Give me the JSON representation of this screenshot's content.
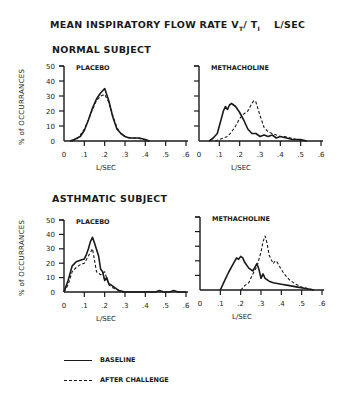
{
  "title": {
    "main": "MEAN INSPIRATORY FLOW RATE V",
    "sub1": "T",
    "slash": "/ T",
    "sub2": "I",
    "unit": "L/SEC"
  },
  "sections": {
    "normal": "NORMAL  SUBJECT",
    "asthmatic": "ASTHMATIC SUBJECT"
  },
  "ylabel": "% of OCCURRANCES",
  "legend": {
    "solid": "BASELINE",
    "dashed": "AFTER CHALLENGE"
  },
  "colors": {
    "ink": "#1a1a1a",
    "background": "#ffffff"
  },
  "chart_data": [
    {
      "type": "line",
      "title": "PLACEBO",
      "panel": "NORMAL SUBJECT",
      "xlabel": "L/SEC",
      "ylabel": "% of OCCURRANCES",
      "xlim": [
        0,
        0.6
      ],
      "ylim": [
        0,
        50
      ],
      "xticks": [
        "0",
        ".1",
        ".2",
        ".3",
        ".4",
        ".5",
        ".6"
      ],
      "yticks": [
        "0",
        "10",
        "20",
        "30",
        "40",
        "50"
      ],
      "series": [
        {
          "name": "BASELINE",
          "style": "solid",
          "x": [
            0.03,
            0.05,
            0.08,
            0.1,
            0.12,
            0.14,
            0.16,
            0.18,
            0.2,
            0.22,
            0.24,
            0.26,
            0.28,
            0.3,
            0.32,
            0.35,
            0.37,
            0.4,
            0.42
          ],
          "y": [
            0,
            1,
            3,
            7,
            14,
            22,
            28,
            32,
            35,
            27,
            16,
            8,
            5,
            3,
            2,
            2,
            2,
            1,
            0
          ]
        },
        {
          "name": "AFTER CHALLENGE",
          "style": "dashed",
          "x": [
            0.04,
            0.06,
            0.08,
            0.1,
            0.12,
            0.14,
            0.16,
            0.18,
            0.2,
            0.22,
            0.24,
            0.26,
            0.28,
            0.3,
            0.33,
            0.36,
            0.39,
            0.42
          ],
          "y": [
            0,
            1,
            4,
            8,
            14,
            21,
            27,
            30,
            31,
            26,
            17,
            9,
            5,
            3,
            2,
            2,
            1,
            0
          ]
        }
      ]
    },
    {
      "type": "line",
      "title": "METHACHOLINE",
      "panel": "NORMAL SUBJECT",
      "xlabel": "L/SEC",
      "xlim": [
        0,
        0.6
      ],
      "ylim": [
        0,
        50
      ],
      "xticks": [
        "0",
        ".1",
        ".2",
        ".3",
        ".4",
        ".5",
        ".6"
      ],
      "series": [
        {
          "name": "BASELINE",
          "style": "solid",
          "x": [
            0.05,
            0.07,
            0.09,
            0.11,
            0.12,
            0.13,
            0.14,
            0.15,
            0.16,
            0.18,
            0.2,
            0.22,
            0.24,
            0.26,
            0.28,
            0.3,
            0.32,
            0.34,
            0.36,
            0.38,
            0.4,
            0.43,
            0.46,
            0.5,
            0.53
          ],
          "y": [
            0,
            2,
            5,
            15,
            20,
            23,
            21,
            24,
            25,
            23,
            19,
            14,
            8,
            5,
            5,
            3,
            4,
            3,
            4,
            2,
            3,
            2,
            1,
            1,
            0
          ]
        },
        {
          "name": "AFTER CHALLENGE",
          "style": "dashed",
          "x": [
            0.08,
            0.1,
            0.12,
            0.14,
            0.16,
            0.18,
            0.2,
            0.22,
            0.24,
            0.26,
            0.27,
            0.28,
            0.3,
            0.32,
            0.34,
            0.36,
            0.38,
            0.4,
            0.42,
            0.45,
            0.48,
            0.52
          ],
          "y": [
            0,
            1,
            2,
            3,
            6,
            10,
            15,
            18,
            20,
            25,
            27,
            26,
            17,
            9,
            6,
            5,
            4,
            3,
            3,
            2,
            1,
            0
          ]
        }
      ]
    },
    {
      "type": "line",
      "title": "PLACEBO",
      "panel": "ASTHMATIC SUBJECT",
      "xlabel": "L/SEC",
      "ylabel": "% of OCCURRANCES",
      "xlim": [
        0,
        0.6
      ],
      "ylim": [
        0,
        50
      ],
      "xticks": [
        "0",
        ".1",
        ".2",
        ".3",
        ".4",
        ".5",
        ".6"
      ],
      "yticks": [
        "0",
        "10",
        "20",
        "30",
        "40",
        "50"
      ],
      "series": [
        {
          "name": "BASELINE",
          "style": "solid",
          "x": [
            0.0,
            0.02,
            0.04,
            0.06,
            0.08,
            0.1,
            0.11,
            0.12,
            0.13,
            0.14,
            0.15,
            0.17,
            0.18,
            0.19,
            0.2,
            0.21,
            0.22,
            0.24,
            0.27,
            0.3,
            0.45,
            0.47,
            0.49,
            0.52,
            0.54,
            0.56,
            0.6
          ],
          "y": [
            0,
            8,
            18,
            21,
            22,
            23,
            26,
            30,
            35,
            38,
            34,
            25,
            16,
            14,
            8,
            10,
            6,
            4,
            1,
            0,
            0,
            1,
            0,
            0,
            1,
            0,
            0
          ]
        },
        {
          "name": "AFTER CHALLENGE",
          "style": "dashed",
          "x": [
            0.0,
            0.02,
            0.04,
            0.06,
            0.08,
            0.1,
            0.12,
            0.14,
            0.16,
            0.18,
            0.2,
            0.22,
            0.24,
            0.27,
            0.3
          ],
          "y": [
            0,
            5,
            14,
            17,
            19,
            20,
            25,
            30,
            14,
            12,
            14,
            5,
            3,
            1,
            0
          ]
        }
      ]
    },
    {
      "type": "line",
      "title": "METHACHOLINE",
      "panel": "ASTHMATIC SUBJECT",
      "xlabel": "L/SEC",
      "xlim": [
        0,
        0.6
      ],
      "ylim": [
        0,
        50
      ],
      "xticks": [
        "0",
        ".1",
        ".2",
        ".3",
        ".4",
        ".5",
        ".6"
      ],
      "series": [
        {
          "name": "BASELINE",
          "style": "solid",
          "x": [
            0.1,
            0.12,
            0.14,
            0.16,
            0.18,
            0.19,
            0.2,
            0.21,
            0.22,
            0.24,
            0.26,
            0.28,
            0.29,
            0.3,
            0.31,
            0.32,
            0.34,
            0.36,
            0.4,
            0.44,
            0.48,
            0.52,
            0.56
          ],
          "y": [
            0,
            6,
            12,
            17,
            22,
            21,
            23,
            22,
            19,
            15,
            13,
            18,
            14,
            8,
            11,
            8,
            6,
            5,
            4,
            3,
            2,
            1,
            0
          ]
        },
        {
          "name": "AFTER CHALLENGE",
          "style": "dashed",
          "x": [
            0.2,
            0.22,
            0.24,
            0.26,
            0.28,
            0.3,
            0.31,
            0.32,
            0.33,
            0.34,
            0.36,
            0.37,
            0.38,
            0.4,
            0.42,
            0.44,
            0.47,
            0.5,
            0.53,
            0.56
          ],
          "y": [
            0,
            3,
            5,
            11,
            16,
            26,
            33,
            37,
            32,
            24,
            18,
            20,
            19,
            14,
            10,
            7,
            4,
            2,
            1,
            0
          ]
        }
      ]
    }
  ]
}
